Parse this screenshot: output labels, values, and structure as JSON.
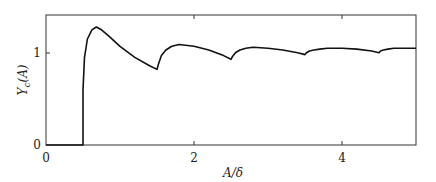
{
  "chart_data": {
    "type": "line",
    "title": "",
    "xlabel": "A/δ",
    "ylabel": "Y_c(A)",
    "xlim": [
      0,
      5
    ],
    "ylim": [
      0,
      1.41
    ],
    "grid": false,
    "legend": null,
    "xticks": [
      0,
      2,
      4
    ],
    "xtick_labels": [
      "0",
      "2",
      "4"
    ],
    "yticks": [
      0,
      1
    ],
    "ytick_labels": [
      "0",
      "1"
    ],
    "series": [
      {
        "name": "Y_c(A)",
        "x": [
          0,
          0.5,
          0.5,
          0.52,
          0.56,
          0.62,
          0.68,
          0.75,
          0.85,
          1.0,
          1.2,
          1.4,
          1.5,
          1.52,
          1.56,
          1.62,
          1.7,
          1.8,
          2.0,
          2.2,
          2.4,
          2.5,
          2.52,
          2.56,
          2.62,
          2.7,
          2.8,
          3.0,
          3.2,
          3.4,
          3.5,
          3.52,
          3.56,
          3.62,
          3.7,
          3.8,
          4.0,
          4.2,
          4.4,
          4.5,
          4.52,
          4.56,
          4.62,
          4.7,
          4.8,
          5.0
        ],
        "y": [
          0,
          0,
          0.6,
          0.95,
          1.15,
          1.25,
          1.28,
          1.25,
          1.18,
          1.07,
          0.95,
          0.86,
          0.82,
          0.88,
          0.97,
          1.03,
          1.07,
          1.09,
          1.07,
          1.03,
          0.97,
          0.93,
          0.96,
          1.0,
          1.03,
          1.05,
          1.06,
          1.05,
          1.03,
          1.0,
          0.98,
          1.0,
          1.02,
          1.03,
          1.04,
          1.05,
          1.05,
          1.04,
          1.02,
          1.0,
          1.02,
          1.03,
          1.04,
          1.05,
          1.05,
          1.05
        ]
      }
    ]
  },
  "labels": {
    "xlabel": "A/δ",
    "ylabel_main": "Y",
    "ylabel_sub": "c",
    "ylabel_arg": "(A)",
    "xtick_0": "0",
    "xtick_2": "2",
    "xtick_4": "4",
    "ytick_0": "0",
    "ytick_1": "1"
  },
  "colors": {
    "line": "#111111",
    "axes": "#333333"
  }
}
